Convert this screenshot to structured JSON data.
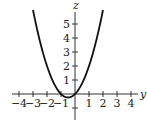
{
  "chart_data": {
    "type": "line",
    "title": "",
    "xlabel": "y",
    "ylabel": "z",
    "function": "z = y^2 + y",
    "xlim": [
      -4.5,
      4.5
    ],
    "ylim": [
      -1.8,
      6.5
    ],
    "x_ticks": [
      -4,
      -3,
      -2,
      -1,
      1,
      2,
      3,
      4
    ],
    "y_ticks": [
      1,
      2,
      3,
      4,
      5
    ],
    "x_tick_labels": [
      "−4",
      "−3",
      "−2",
      "−1",
      "1",
      "2",
      "3",
      "4"
    ],
    "y_tick_labels": [
      "1",
      "2",
      "3",
      "4",
      "5"
    ],
    "series": [
      {
        "name": "parabola",
        "x": [
          -3,
          -2.5,
          -2,
          -1.5,
          -1,
          -0.5,
          0,
          0.5,
          1,
          1.5,
          2
        ],
        "values": [
          6,
          3.75,
          2,
          0.75,
          0,
          -0.25,
          0,
          0.75,
          2,
          3.75,
          6
        ]
      }
    ],
    "grid": false,
    "legend": "none"
  },
  "axes": {
    "horizontal_label": "y",
    "vertical_label": "z"
  }
}
